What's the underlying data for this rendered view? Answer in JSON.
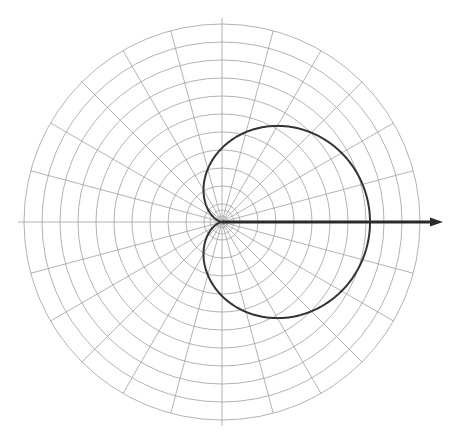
{
  "figure": {
    "width": 461,
    "height": 436,
    "background": "#ffffff",
    "title": "",
    "caption": ""
  },
  "chart_data": {
    "type": "line",
    "subtype": "polar",
    "title": "",
    "subtitle": "",
    "xlabel": "",
    "ylabel": "",
    "grid": true,
    "legend": null,
    "polar": {
      "center_x": 222,
      "center_y": 222,
      "outer_radius": 198,
      "radial_rings": 11,
      "ring_spacing_px": 18,
      "inner_micro_rings": 2,
      "angular_spokes": 24,
      "spoke_step_degrees": 15,
      "r_ticks": [
        1,
        2,
        3,
        4,
        5,
        6,
        7,
        8,
        9,
        10,
        11
      ],
      "r_tick_labels": [],
      "theta_tick_labels": [],
      "grid_color": "#9b9b9b",
      "grid_width": 0.9
    },
    "axis_arrow": {
      "name": "reference-axis-arrow",
      "from_x": 222,
      "from_y": 222,
      "to_x": 443,
      "to_y": 222,
      "angle_degrees": 0,
      "color": "#2a2a2a",
      "width": 3.2,
      "head_length": 13,
      "head_width": 9
    },
    "series": [
      {
        "name": "cardioid-pattern",
        "color": "#333333",
        "width": 2.0,
        "closed": true,
        "equation": "r = a(1 + cos(theta))",
        "a_px": 74,
        "max_r_px": 148,
        "theta_degrees": [
          0,
          10,
          20,
          30,
          40,
          50,
          60,
          70,
          80,
          90,
          100,
          110,
          120,
          130,
          140,
          150,
          160,
          170,
          180,
          190,
          200,
          210,
          220,
          230,
          240,
          250,
          260,
          270,
          280,
          290,
          300,
          310,
          320,
          330,
          340,
          350
        ],
        "r_px": [
          148,
          146,
          143,
          138,
          131,
          122,
          111,
          99,
          87,
          74,
          61,
          49,
          37,
          26,
          17,
          10,
          5,
          1,
          0,
          1,
          5,
          10,
          17,
          26,
          37,
          49,
          61,
          74,
          87,
          99,
          111,
          122,
          131,
          138,
          143,
          146
        ],
        "extent_px": {
          "right_x": 370,
          "left_x": 188,
          "top_y": 116,
          "bottom_y": 330
        }
      }
    ],
    "annotations": []
  }
}
